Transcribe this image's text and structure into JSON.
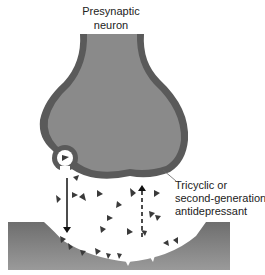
{
  "labels": {
    "presynaptic_line1": "Presynaptic",
    "presynaptic_line2": "neuron",
    "drug_line1": "Tricyclic or",
    "drug_line2": "second-generation",
    "drug_line3": "antidepressant"
  },
  "colors": {
    "neuron_fill": "#8a8a8a",
    "neuron_membrane": "#5a5a5a",
    "postsynaptic_fill": "#7c7c7c",
    "neurotransmitter": "#3a3a3a",
    "arrow": "#111111",
    "background": "#ffffff"
  },
  "arrows": [
    {
      "name": "release-arrow",
      "direction": "down",
      "style": "solid"
    },
    {
      "name": "reuptake-arrow",
      "direction": "up",
      "style": "dashed"
    }
  ]
}
